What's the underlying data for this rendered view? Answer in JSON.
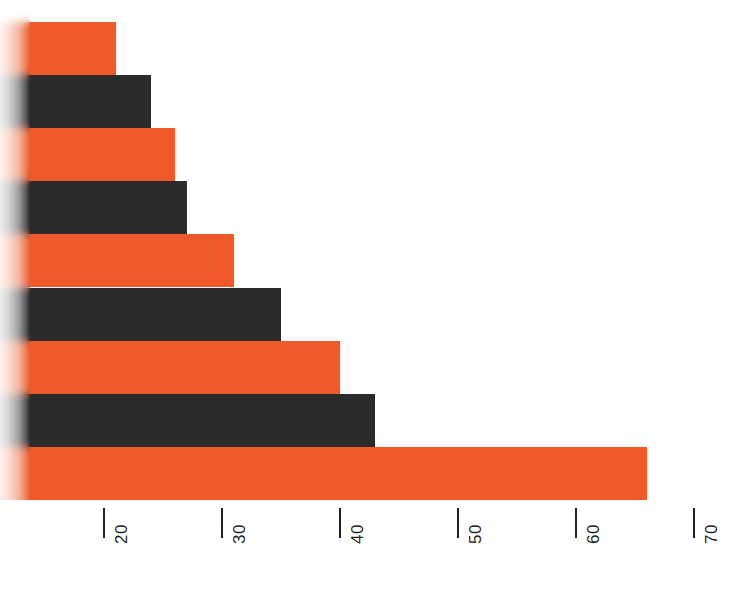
{
  "chart_data": {
    "type": "bar",
    "orientation": "horizontal",
    "title": "",
    "subtitle": "",
    "xlabel": "",
    "ylabel": "",
    "categories": [
      "1",
      "2",
      "3",
      "4",
      "5",
      "6",
      "7",
      "8",
      "9"
    ],
    "values": [
      21,
      24,
      26,
      27,
      31,
      35,
      40,
      43,
      66
    ],
    "bar_colors": [
      "orange",
      "dark",
      "orange",
      "dark",
      "orange",
      "dark",
      "orange",
      "dark",
      "orange"
    ],
    "xlim": [
      15.5,
      71.5
    ],
    "xticks": [
      20,
      30,
      40,
      50,
      60,
      70
    ],
    "xtick_labels": [
      "20",
      "30",
      "40",
      "50",
      "60",
      "70"
    ],
    "tick_label_rotation": -90,
    "grid": false,
    "legend": null,
    "annotations": []
  },
  "colors": {
    "orange": "#F05A2A",
    "dark": "#2B2B2B",
    "axis": "#231f20",
    "background": "#FFFFFF"
  }
}
